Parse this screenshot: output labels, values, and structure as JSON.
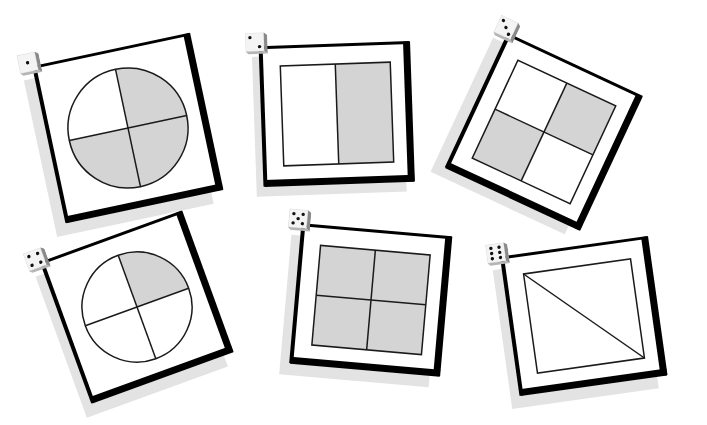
{
  "worksheet": {
    "colors": {
      "shade": "#d4d4d4",
      "line": "#1a1a1a",
      "frame": "#000000",
      "shadow": "#e3e3e3"
    },
    "cards": [
      {
        "number": 1,
        "die_face": 1,
        "shape": "circle",
        "parts": 4,
        "shaded_parts": 3,
        "shaded": [
          "top-right",
          "bottom-left",
          "bottom-right"
        ],
        "fraction": "3/4",
        "x": 48,
        "y": 48,
        "w": 160,
        "h": 160,
        "rotate": -12,
        "shadow_dx": -12,
        "shadow_dy": 12
      },
      {
        "number": 2,
        "die_face": 2,
        "shape": "rectangle",
        "parts": 2,
        "shaded_parts": 1,
        "shaded": [
          "right"
        ],
        "fraction": "1/2",
        "x": 262,
        "y": 44,
        "w": 150,
        "h": 140,
        "rotate": -2,
        "shadow_dx": -8,
        "shadow_dy": 10
      },
      {
        "number": 3,
        "die_face": 3,
        "shape": "square",
        "parts": 4,
        "shaded_parts": 2,
        "shaded": [
          "top-right",
          "bottom-left"
        ],
        "fraction": "2/4",
        "x": 470,
        "y": 58,
        "w": 148,
        "h": 148,
        "rotate": 25,
        "shadow_dx": -12,
        "shadow_dy": 10
      },
      {
        "number": 4,
        "die_face": 4,
        "shape": "circle",
        "parts": 4,
        "shaded_parts": 1,
        "shaded": [
          "top-right"
        ],
        "fraction": "1/4",
        "x": 62,
        "y": 232,
        "w": 150,
        "h": 150,
        "rotate": -20,
        "shadow_dx": -10,
        "shadow_dy": 12
      },
      {
        "number": 5,
        "die_face": 5,
        "shape": "square",
        "parts": 4,
        "shaded_parts": 4,
        "shaded": [
          "top-left",
          "top-right",
          "bottom-left",
          "bottom-right"
        ],
        "fraction": "4/4",
        "x": 296,
        "y": 230,
        "w": 150,
        "h": 140,
        "rotate": 5,
        "shadow_dx": -10,
        "shadow_dy": 12
      },
      {
        "number": 6,
        "die_face": 6,
        "shape": "square-diagonal",
        "parts": 2,
        "shaded_parts": 0,
        "shaded": [],
        "fraction": "0/2",
        "x": 510,
        "y": 246,
        "w": 148,
        "h": 140,
        "rotate": -8,
        "shadow_dx": -10,
        "shadow_dy": 12
      }
    ]
  }
}
